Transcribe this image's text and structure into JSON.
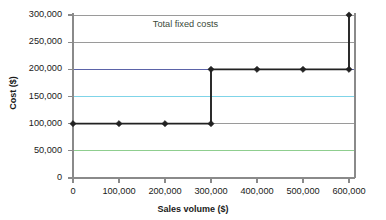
{
  "chart_data": {
    "type": "line",
    "title": "",
    "xlabel": "Sales volume ($)",
    "ylabel": "Cost ($)",
    "xlim": [
      0,
      600000
    ],
    "ylim": [
      0,
      300000
    ],
    "grid": true,
    "legend_position": "none",
    "x_ticks": [
      "0",
      "100,000",
      "200,000",
      "300,000",
      "400,000",
      "500,000",
      "600,000"
    ],
    "x_tick_values": [
      0,
      100000,
      200000,
      300000,
      400000,
      500000,
      600000
    ],
    "y_ticks": [
      "0",
      "50,000",
      "100,000",
      "150,000",
      "200,000",
      "250,000",
      "300,000"
    ],
    "y_tick_values": [
      0,
      50000,
      100000,
      150000,
      200000,
      250000,
      300000
    ],
    "annotations": [
      {
        "text": "Total fixed costs",
        "x": 330000,
        "y": 282000
      }
    ],
    "series": [
      {
        "name": "Total fixed costs",
        "color": "#222222",
        "marker": "diamond",
        "step": "post",
        "x": [
          0,
          100000,
          200000,
          300000,
          300000,
          400000,
          500000,
          600000,
          600000
        ],
        "values": [
          100000,
          100000,
          100000,
          100000,
          200000,
          200000,
          200000,
          200000,
          300000
        ],
        "points": [
          {
            "x": 0,
            "y": 100000
          },
          {
            "x": 100000,
            "y": 100000
          },
          {
            "x": 200000,
            "y": 100000
          },
          {
            "x": 300000,
            "y": 100000
          },
          {
            "x": 300000,
            "y": 200000
          },
          {
            "x": 400000,
            "y": 200000
          },
          {
            "x": 500000,
            "y": 200000
          },
          {
            "x": 600000,
            "y": 200000
          },
          {
            "x": 600000,
            "y": 300000
          }
        ]
      }
    ],
    "gridline_colors": {
      "50000": "#8fce8f",
      "100000": "#9a9a9a",
      "150000": "#7fd4e8",
      "200000": "#5b63a8",
      "250000": "#9a9a9a",
      "300000": "#9a9a9a"
    },
    "axis_color": "#8a8a8a",
    "plot_background": "#ffffff"
  }
}
